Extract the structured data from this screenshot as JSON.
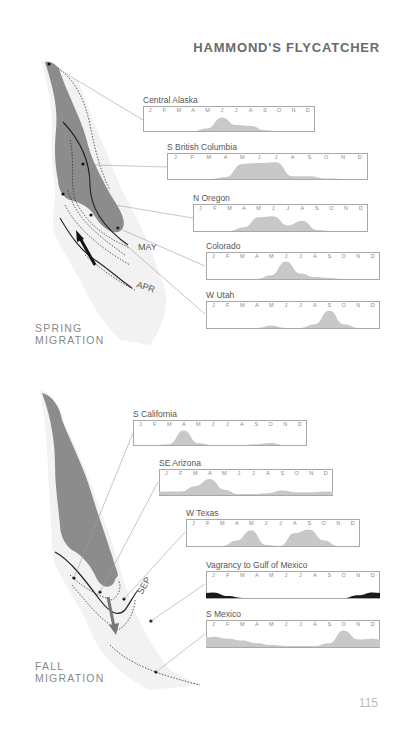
{
  "page": {
    "title": "HAMMOND'S FLYCATCHER",
    "page_number": "115"
  },
  "spring": {
    "label_line1": "SPRING",
    "label_line2": "MIGRATION",
    "map_labels": {
      "may": "MAY",
      "apr": "APR"
    }
  },
  "fall": {
    "label_line1": "FALL",
    "label_line2": "MIGRATION",
    "map_labels": {
      "sep": "SEP"
    }
  },
  "months": [
    "J",
    "F",
    "M",
    "A",
    "M",
    "J",
    "J",
    "A",
    "S",
    "O",
    "N",
    "D"
  ],
  "colors": {
    "range_fill": "#8c8c8c",
    "chart_fill": "#c8c8c8",
    "vagrancy_fill": "#1a1a1a",
    "frame": "#a8a8a8",
    "leader": "#9a9a9a"
  },
  "chart_data": [
    {
      "type": "area",
      "title": "Central Alaska",
      "section": "spring",
      "categories": [
        "J",
        "F",
        "M",
        "A",
        "M",
        "J",
        "J",
        "A",
        "S",
        "O",
        "N",
        "D"
      ],
      "values": [
        0,
        0,
        0,
        0,
        0.15,
        0.8,
        0.35,
        0.3,
        0.05,
        0,
        0,
        0
      ]
    },
    {
      "type": "area",
      "title": "S British Columbia",
      "section": "spring",
      "categories": [
        "J",
        "F",
        "M",
        "A",
        "M",
        "J",
        "J",
        "A",
        "S",
        "O",
        "N",
        "D"
      ],
      "values": [
        0,
        0,
        0,
        0.1,
        0.85,
        0.9,
        0.95,
        0.15,
        0.15,
        0.02,
        0,
        0
      ]
    },
    {
      "type": "area",
      "title": "N Oregon",
      "section": "spring",
      "categories": [
        "J",
        "F",
        "M",
        "A",
        "M",
        "J",
        "J",
        "A",
        "S",
        "O",
        "N",
        "D"
      ],
      "values": [
        0,
        0,
        0,
        0.2,
        0.75,
        0.8,
        0.3,
        0.55,
        0.05,
        0,
        0,
        0
      ]
    },
    {
      "type": "area",
      "title": "Colorado",
      "section": "spring",
      "categories": [
        "J",
        "F",
        "M",
        "A",
        "M",
        "J",
        "J",
        "A",
        "S",
        "O",
        "N",
        "D"
      ],
      "values": [
        0,
        0,
        0,
        0,
        0.2,
        0.95,
        0.3,
        0.1,
        0.05,
        0,
        0,
        0
      ]
    },
    {
      "type": "area",
      "title": "W Utah",
      "section": "spring",
      "categories": [
        "J",
        "F",
        "M",
        "A",
        "M",
        "J",
        "J",
        "A",
        "S",
        "O",
        "N",
        "D"
      ],
      "values": [
        0,
        0,
        0,
        0,
        0.12,
        0,
        0,
        0.2,
        0.95,
        0.2,
        0,
        0
      ]
    },
    {
      "type": "area",
      "title": "S California",
      "section": "fall",
      "categories": [
        "J",
        "F",
        "M",
        "A",
        "M",
        "J",
        "J",
        "A",
        "S",
        "O",
        "N",
        "D"
      ],
      "values": [
        0,
        0,
        0.05,
        0.85,
        0.1,
        0,
        0,
        0,
        0.05,
        0.12,
        0,
        0
      ]
    },
    {
      "type": "area",
      "title": "SE Arizona",
      "section": "fall",
      "categories": [
        "J",
        "F",
        "M",
        "A",
        "M",
        "J",
        "J",
        "A",
        "S",
        "O",
        "N",
        "D"
      ],
      "values": [
        0.2,
        0.2,
        0.5,
        0.9,
        0.3,
        0.05,
        0.05,
        0.1,
        0.25,
        0.15,
        0.15,
        0.2
      ]
    },
    {
      "type": "area",
      "title": "W Texas",
      "section": "fall",
      "categories": [
        "J",
        "F",
        "M",
        "A",
        "M",
        "J",
        "J",
        "A",
        "S",
        "O",
        "N",
        "D"
      ],
      "values": [
        0,
        0,
        0,
        0.3,
        0.85,
        0.05,
        0,
        0.7,
        0.9,
        0.3,
        0,
        0
      ]
    },
    {
      "type": "area",
      "title": "Vagrancy to Gulf of Mexico",
      "section": "fall",
      "categories": [
        "J",
        "F",
        "M",
        "A",
        "M",
        "J",
        "J",
        "A",
        "S",
        "O",
        "N",
        "D"
      ],
      "values": [
        0.3,
        0.1,
        0,
        0,
        0,
        0,
        0,
        0,
        0,
        0,
        0.15,
        0.3
      ]
    },
    {
      "type": "area",
      "title": "S Mexico",
      "section": "fall",
      "categories": [
        "J",
        "F",
        "M",
        "A",
        "M",
        "J",
        "J",
        "A",
        "S",
        "O",
        "N",
        "D"
      ],
      "values": [
        0.55,
        0.45,
        0.35,
        0.2,
        0.1,
        0.05,
        0.05,
        0.05,
        0.2,
        0.9,
        0.4,
        0.45
      ]
    }
  ]
}
